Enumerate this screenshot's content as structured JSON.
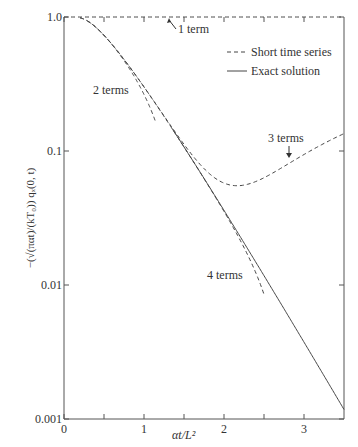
{
  "chart_data": {
    "type": "line",
    "title": "",
    "xlabel": "αt/L²",
    "ylabel": "−(√(παt)/(kT₀)) qₓ(0, t)",
    "xlim": [
      0,
      3.5
    ],
    "ylim": [
      0.001,
      1.0
    ],
    "yscale": "log",
    "grid": false,
    "legend_position": "top-right",
    "x_ticks": [
      0,
      0.5,
      1,
      1.5,
      2,
      2.5,
      3
    ],
    "x_tick_labels": [
      "0",
      "",
      "1",
      "",
      "2",
      "",
      "3"
    ],
    "y_ticks": [
      1.0,
      0.1,
      0.01,
      0.001
    ],
    "y_tick_labels": [
      "1.0",
      "0.1",
      "0.01",
      "0.001"
    ],
    "legend": [
      {
        "label": "Short time series",
        "style": "dashed"
      },
      {
        "label": "Exact solution",
        "style": "solid"
      }
    ],
    "series": [
      {
        "name": "1 term",
        "style": "dashed",
        "x_range": [
          0,
          3.5
        ],
        "formula": "1",
        "points": [
          [
            0,
            1
          ],
          [
            3.5,
            1
          ]
        ]
      },
      {
        "name": "2 terms",
        "style": "dashed",
        "x_range": [
          0.2,
          1.15
        ],
        "formula": "1-2exp(-1/t)",
        "points": [
          [
            0.2,
            0.9865
          ],
          [
            0.4,
            0.8358
          ],
          [
            0.6,
            0.6223
          ],
          [
            0.8,
            0.427
          ],
          [
            1.0,
            0.2642
          ],
          [
            1.15,
            0.1612
          ]
        ]
      },
      {
        "name": "3 terms",
        "style": "dashed",
        "x_range": [
          0.2,
          3.5
        ],
        "formula": "1-2exp(-1/t)+2exp(-4/t)",
        "points": [
          [
            0.5,
            0.7294
          ],
          [
            1.0,
            0.3008
          ],
          [
            1.5,
            0.1021
          ],
          [
            2.0,
            0.0577
          ],
          [
            2.2,
            0.0552
          ],
          [
            2.5,
            0.0614
          ],
          [
            3.0,
            0.0805
          ],
          [
            3.5,
            0.101
          ]
        ]
      },
      {
        "name": "4 terms",
        "style": "dashed",
        "x_range": [
          0.3,
          2.5
        ],
        "formula": "1-2exp(-1/t)+2exp(-4/t)-2exp(-9/t)",
        "points": [
          [
            1.0,
            0.3006
          ],
          [
            1.5,
            0.0971
          ],
          [
            2.0,
            0.0355
          ],
          [
            2.5,
            0.0068
          ]
        ]
      },
      {
        "name": "Exact solution",
        "style": "solid",
        "x_range": [
          1.35,
          3.5
        ],
        "formula": "2sqrt(pi t) sum exp(-(2n+1)^2 pi^2 t/4)",
        "points": [
          [
            1.5,
            0.1184
          ],
          [
            2.0,
            0.036
          ],
          [
            2.5,
            0.0107
          ],
          [
            3.0,
            0.0036
          ],
          [
            3.5,
            0.0012
          ]
        ]
      }
    ],
    "annotations": [
      {
        "text": "1 term",
        "target_x": 1.55,
        "target_y": 1.0
      },
      {
        "text": "2 terms",
        "target_x": 0.7
      },
      {
        "text": "3 terms",
        "target_x": 2.75
      },
      {
        "text": "4 terms",
        "target_x": 2.35
      }
    ]
  }
}
